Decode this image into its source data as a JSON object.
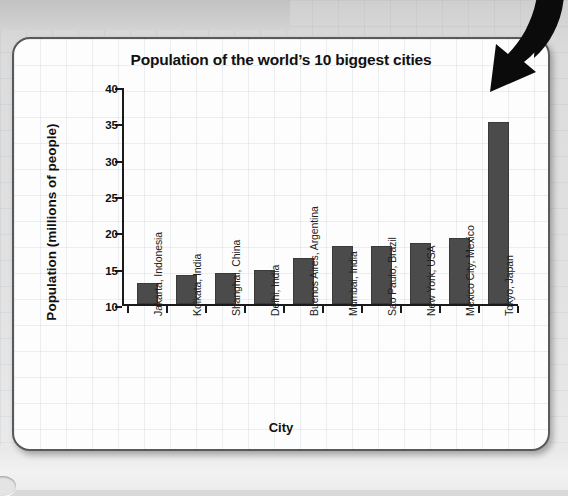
{
  "chart_data": {
    "type": "bar",
    "title": "Population of the world’s 10 biggest cities",
    "xlabel": "City",
    "ylabel": "Population (millions of people)",
    "categories": [
      "Jakarta, Indonesia",
      "Kolkata, India",
      "Shanghai, China",
      "Delhi, India",
      "Buenos Aires, Argentina",
      "Mumbai, India",
      "Sao Paulo, Brazil",
      "New York, USA",
      "Mexico City, Mexico",
      "Tokyo, Japan"
    ],
    "values": [
      13.2,
      14.3,
      14.5,
      15.0,
      16.6,
      18.2,
      18.3,
      18.7,
      19.4,
      35.3
    ],
    "ylim": [
      10,
      40
    ],
    "ytick_labels": [
      "40",
      "35",
      "30",
      "25",
      "20",
      "15",
      "10"
    ],
    "ytick_values": [
      40,
      35,
      30,
      25,
      20,
      15,
      10
    ],
    "ystep": 5,
    "grid": false,
    "legend": "none",
    "bar_color": "#4b4b4b",
    "axis_color": "#1a1a1a"
  },
  "page": {
    "background_color": "#dcdcdc",
    "card_color": "#fdfdfd",
    "card_border_color": "#595959",
    "arrow_color": "#000000",
    "arrow_icon_name": "curved-down-arrow-icon"
  }
}
